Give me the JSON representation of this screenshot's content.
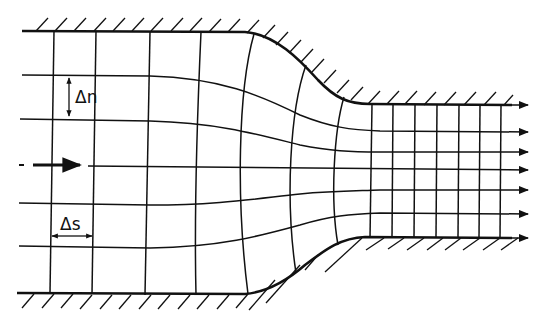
{
  "figure": {
    "type": "flow-net",
    "labels": {
      "delta_n": "Δn",
      "delta_s": "Δs"
    },
    "colors": {
      "line": "#111111",
      "background": "#ffffff"
    },
    "inflow_arrow": "flow-direction-arrow",
    "outlet_arrow_count": 7
  }
}
